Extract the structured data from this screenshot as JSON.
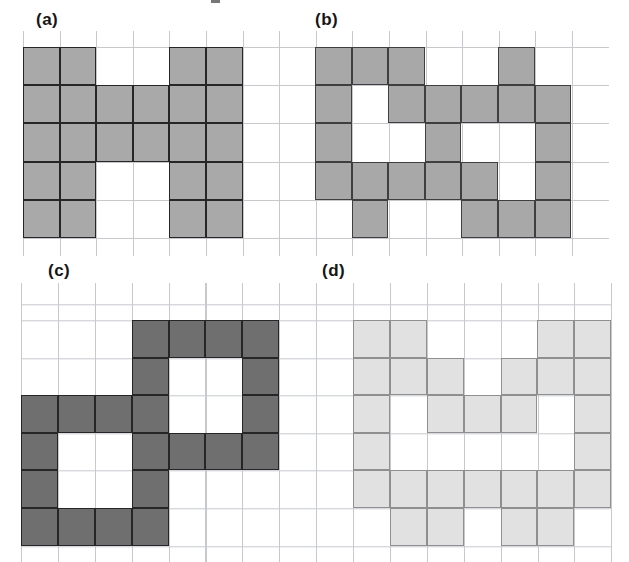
{
  "figure": {
    "panels": [
      {
        "id": "a",
        "label": "(a)",
        "fill_color": "#a9a9a9",
        "border_color": "#262626",
        "grid_rows": 5,
        "grid_cols": 6,
        "cells": [
          "110011",
          "111111",
          "111111",
          "110011",
          "110011"
        ]
      },
      {
        "id": "b",
        "label": "(b)",
        "fill_color": "#a8a8a8",
        "border_color": "#3f3f3f",
        "grid_rows": 5,
        "grid_cols": 7,
        "cells": [
          "1110010",
          "1011111",
          "1001001",
          "1111101",
          "0100111"
        ]
      },
      {
        "id": "c",
        "label": "(c)",
        "fill_color": "#6f6f6f",
        "border_color": "#262626",
        "grid_rows": 6,
        "grid_cols": 7,
        "cells": [
          "0001111",
          "0001001",
          "1111001",
          "1001111",
          "1001000",
          "1111000"
        ]
      },
      {
        "id": "d",
        "label": "(d)",
        "fill_color": "#e1e1e1",
        "border_color": "#8f8f8f",
        "grid_rows": 6,
        "grid_cols": 7,
        "cells": [
          "1100011",
          "1110111",
          "1011101",
          "1000001",
          "1111111",
          "0110110"
        ]
      }
    ],
    "colors": {
      "background": "#ffffff",
      "grid_line": "#c7c9ce"
    }
  }
}
